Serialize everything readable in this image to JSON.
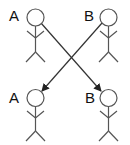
{
  "diagram": {
    "type": "role-swap",
    "colors": {
      "line": "#555555",
      "arrow": "#333333",
      "text": "#111111",
      "background": "#ffffff"
    },
    "top_row": [
      {
        "label": "A",
        "position": "top-left"
      },
      {
        "label": "B",
        "position": "top-right"
      }
    ],
    "bottom_row": [
      {
        "label": "A",
        "position": "bottom-left"
      },
      {
        "label": "B",
        "position": "bottom-right"
      }
    ],
    "arrows": [
      {
        "from": "top-left A",
        "to": "bottom-right B"
      },
      {
        "from": "top-right B",
        "to": "bottom-left A"
      }
    ]
  }
}
